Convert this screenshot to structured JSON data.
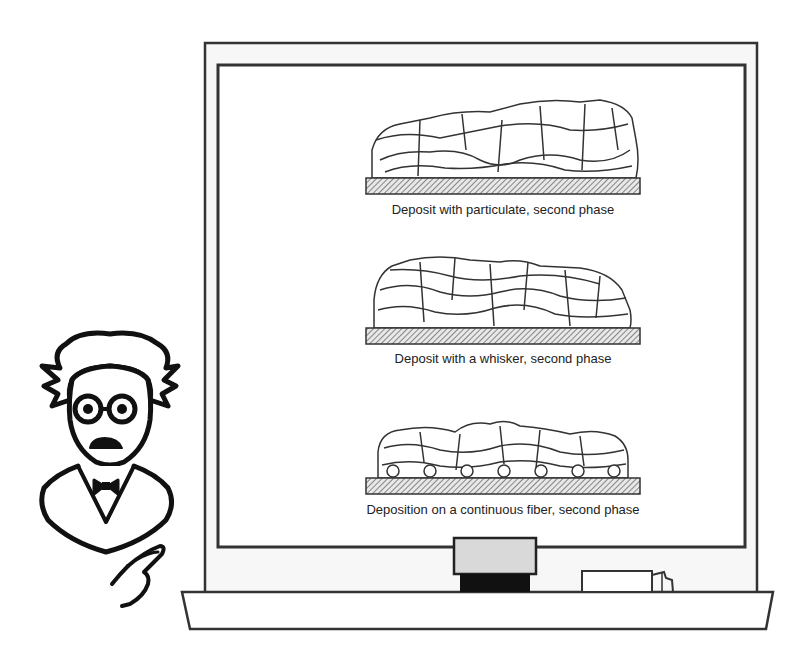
{
  "board": {
    "frame_color": "#333333",
    "fill": "#fbfbfb",
    "eraser_top_color": "#d8d8d8",
    "eraser_base_color": "#111111"
  },
  "panels": [
    {
      "id": "particulate",
      "caption": "Deposit with particulate, second phase"
    },
    {
      "id": "whisker",
      "caption": "Deposit with a whisker, second phase"
    },
    {
      "id": "fiber",
      "caption": "Deposition on a continuous fiber, second phase"
    }
  ],
  "character": {
    "description": "professor-with-glasses-bowtie-pointing"
  }
}
